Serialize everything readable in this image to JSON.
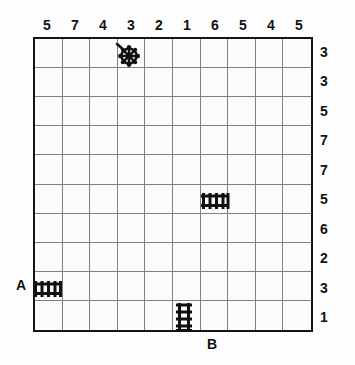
{
  "puzzle": {
    "title": "Battleship-style logic grid puzzle",
    "grid": {
      "columns": 10,
      "rows": 10
    },
    "column_clues": [
      5,
      7,
      4,
      3,
      2,
      1,
      6,
      5,
      4,
      5
    ],
    "row_clues": [
      3,
      3,
      5,
      7,
      7,
      5,
      6,
      2,
      3,
      1
    ],
    "labels": {
      "a": "A",
      "b": "B"
    },
    "colors": {
      "ink": "#141414",
      "gridline": "#808080",
      "paper": "#fbfbfb"
    },
    "pieces": [
      {
        "name": "ship-wheel",
        "col": 4,
        "row": 1,
        "orientation": "diagonal"
      },
      {
        "name": "ladder-horizontal",
        "col": 7,
        "row": 6,
        "orientation": "horizontal"
      },
      {
        "name": "ladder-horizontal-a",
        "col": 1,
        "row": 9,
        "orientation": "horizontal"
      },
      {
        "name": "ladder-vertical-b",
        "col": 6,
        "row": 10,
        "orientation": "vertical"
      }
    ]
  }
}
